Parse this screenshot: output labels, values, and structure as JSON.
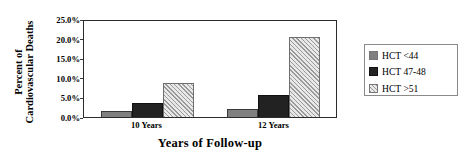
{
  "chart_data": {
    "type": "bar",
    "title": "",
    "xlabel": "Years of Follow-up",
    "ylabel_line1": "Percent of",
    "ylabel_line2": "Cardiovascular Deaths",
    "categories": [
      "10 Years",
      "12 Years"
    ],
    "series": [
      {
        "name": "HCT <44",
        "values": [
          1.6,
          2.0
        ],
        "color": "#808080"
      },
      {
        "name": "HCT 47-48",
        "values": [
          3.6,
          5.5
        ],
        "color": "#222222"
      },
      {
        "name": "HCT >51",
        "values": [
          8.8,
          20.4
        ],
        "color": "#dcdcdc"
      }
    ],
    "ylim": [
      0,
      25
    ],
    "ytick_values": [
      0,
      5,
      10,
      15,
      20,
      25
    ],
    "ytick_labels": [
      "0.0%",
      "5.0%",
      "10.0%",
      "15.0%",
      "20.0%",
      "25.0%"
    ],
    "grid": false,
    "legend_position": "right-outside"
  },
  "legend": {
    "items": [
      {
        "label": "HCT <44"
      },
      {
        "label": "HCT 47-48"
      },
      {
        "label": "HCT >51"
      }
    ]
  }
}
